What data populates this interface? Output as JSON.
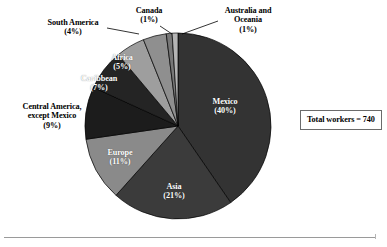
{
  "figure": {
    "total_box_label": "Total workers = 740",
    "background_color": "#ffffff",
    "rule_color": "#9a9a9a"
  },
  "chart_data": {
    "type": "pie",
    "title": "",
    "subtitle": "",
    "xlabel": "",
    "ylabel": "",
    "legend_position": "none",
    "grid": false,
    "total_label": "Total workers = 740",
    "total_value": 740,
    "units": "percent",
    "start_angle_deg": 0,
    "direction": "clockwise",
    "categories": [
      "Mexico",
      "Asia",
      "Europe",
      "Central America, except Mexico",
      "Caribbean",
      "Africa",
      "South America",
      "Canada",
      "Australia and Oceania"
    ],
    "values": [
      40,
      21,
      11,
      9,
      7,
      5,
      4,
      1,
      1
    ],
    "colors": [
      "#333333",
      "#3b3b3b",
      "#8a8a8a",
      "#1c1c1c",
      "#242424",
      "#9e9e9e",
      "#8f8f8f",
      "#787878",
      "#b4b4b4"
    ],
    "slices": [
      {
        "label": "Mexico",
        "value_pct": 40,
        "value_text": "(40%)",
        "label_line1": "Mexico",
        "label_line2": "(40%)",
        "color": "#333333",
        "label_placement": "inside",
        "label_color": "#ffffff"
      },
      {
        "label": "Asia",
        "value_pct": 21,
        "value_text": "(21%)",
        "label_line1": "Asia",
        "label_line2": "(21%)",
        "color": "#3b3b3b",
        "label_placement": "inside",
        "label_color": "#ffffff"
      },
      {
        "label": "Europe",
        "value_pct": 11,
        "value_text": "(11%)",
        "label_line1": "Europe",
        "label_line2": "(11%)",
        "color": "#8a8a8a",
        "label_placement": "inside",
        "label_color": "#ffffff"
      },
      {
        "label": "Central America, except Mexico",
        "value_pct": 9,
        "value_text": "(9%)",
        "label_line1": "Central America,",
        "label_line2": "except Mexico",
        "label_line3": "(9%)",
        "color": "#1c1c1c",
        "label_placement": "outside",
        "label_color": "#000000"
      },
      {
        "label": "Caribbean",
        "value_pct": 7,
        "value_text": "(7%)",
        "label_line1": "Caribbean",
        "label_line2": "(7%)",
        "color": "#242424",
        "label_placement": "inside",
        "label_color": "#ffffff"
      },
      {
        "label": "Africa",
        "value_pct": 5,
        "value_text": "(5%)",
        "label_line1": "Africa",
        "label_line2": "(5%)",
        "color": "#9e9e9e",
        "label_placement": "inside",
        "label_color": "#ffffff"
      },
      {
        "label": "South America",
        "value_pct": 4,
        "value_text": "(4%)",
        "label_line1": "South America",
        "label_line2": "(4%)",
        "color": "#8f8f8f",
        "label_placement": "outside",
        "label_color": "#000000"
      },
      {
        "label": "Canada",
        "value_pct": 1,
        "value_text": "(1%)",
        "label_line1": "Canada",
        "label_line2": "(1%)",
        "color": "#787878",
        "label_placement": "outside",
        "label_color": "#000000"
      },
      {
        "label": "Australia and Oceania",
        "value_pct": 1,
        "value_text": "(1%)",
        "label_line1": "Australia and",
        "label_line2": "Oceania",
        "label_line3": "(1%)",
        "color": "#b4b4b4",
        "label_placement": "outside",
        "label_color": "#000000"
      }
    ]
  },
  "labels": {
    "mexico": "Mexico\n(40%)",
    "asia": "Asia\n(21%)",
    "europe": "Europe\n(11%)",
    "central_america": "Central America,\nexcept Mexico\n(9%)",
    "caribbean": "Caribbean\n(7%)",
    "africa": "Africa\n(5%)",
    "south_america": "South America\n(4%)",
    "canada": "Canada\n(1%)",
    "australia_oceania": "Australia and\nOceania\n(1%)"
  }
}
